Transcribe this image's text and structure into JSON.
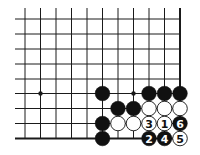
{
  "diagram": {
    "type": "go-board-corner",
    "columns": 11,
    "rows": 9,
    "col_x": [
      25,
      40.5,
      56,
      71.5,
      87,
      102.5,
      118,
      133.5,
      149,
      164.5,
      180
    ],
    "row_y": [
      19,
      34,
      49,
      64,
      79,
      93.5,
      108.5,
      123.5,
      138.5
    ],
    "line_left_x": 15,
    "line_top_y": 8,
    "right_edge": true,
    "bottom_edge": true,
    "star_points": [
      {
        "col": 1,
        "row": 5
      },
      {
        "col": 7,
        "row": 5
      }
    ],
    "stones": [
      {
        "col": 5,
        "row": 5,
        "color": "black",
        "label": ""
      },
      {
        "col": 8,
        "row": 5,
        "color": "black",
        "label": ""
      },
      {
        "col": 9,
        "row": 5,
        "color": "black",
        "label": ""
      },
      {
        "col": 10,
        "row": 5,
        "color": "black",
        "label": ""
      },
      {
        "col": 6,
        "row": 6,
        "color": "black",
        "label": ""
      },
      {
        "col": 7,
        "row": 6,
        "color": "black",
        "label": ""
      },
      {
        "col": 8,
        "row": 6,
        "color": "white",
        "label": ""
      },
      {
        "col": 9,
        "row": 6,
        "color": "white",
        "label": ""
      },
      {
        "col": 10,
        "row": 6,
        "color": "white",
        "label": ""
      },
      {
        "col": 5,
        "row": 7,
        "color": "black",
        "label": ""
      },
      {
        "col": 6,
        "row": 7,
        "color": "white",
        "label": ""
      },
      {
        "col": 7,
        "row": 7,
        "color": "white",
        "label": ""
      },
      {
        "col": 8,
        "row": 7,
        "color": "white",
        "label": "3"
      },
      {
        "col": 9,
        "row": 7,
        "color": "white",
        "label": "1"
      },
      {
        "col": 10,
        "row": 7,
        "color": "black",
        "label": "6"
      },
      {
        "col": 5,
        "row": 8,
        "color": "black",
        "label": ""
      },
      {
        "col": 8,
        "row": 8,
        "color": "black",
        "label": "2"
      },
      {
        "col": 9,
        "row": 8,
        "color": "black",
        "label": "4"
      },
      {
        "col": 10,
        "row": 8,
        "color": "white",
        "label": "5"
      }
    ],
    "colors": {
      "line": "#1a1a1a",
      "black_stone": "#111111",
      "white_stone": "#ffffff",
      "background": "#ffffff"
    }
  }
}
